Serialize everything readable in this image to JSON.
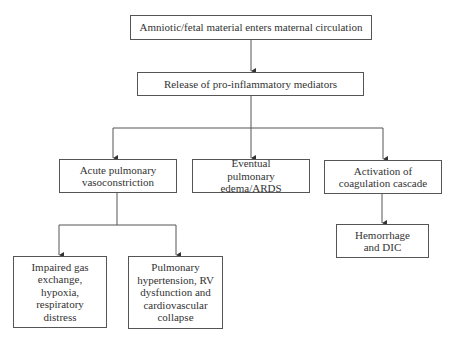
{
  "diagram": {
    "type": "flowchart",
    "nodes": [
      {
        "id": "n1",
        "label": "Amniotic/fetal material enters maternal circulation"
      },
      {
        "id": "n2",
        "label": "Release of pro-inflammatory mediators"
      },
      {
        "id": "n3",
        "label": "Acute pulmonary vasoconstriction"
      },
      {
        "id": "n4",
        "label": "Eventual pulmonary edema/ARDS"
      },
      {
        "id": "n5",
        "label": "Activation of coagulation cascade"
      },
      {
        "id": "n6",
        "label": "Impaired gas exchange, hypoxia, respiratory distress"
      },
      {
        "id": "n7",
        "label": "Pulmonary hypertension, RV dysfunction and cardiovascular collapse"
      },
      {
        "id": "n8",
        "label": "Hemorrhage and DIC"
      }
    ],
    "edges": [
      {
        "from": "n1",
        "to": "n2"
      },
      {
        "from": "n2",
        "to": "n3"
      },
      {
        "from": "n2",
        "to": "n4"
      },
      {
        "from": "n2",
        "to": "n5"
      },
      {
        "from": "n3",
        "to": "n6"
      },
      {
        "from": "n3",
        "to": "n7"
      },
      {
        "from": "n5",
        "to": "n8"
      }
    ],
    "colors": {
      "line": "#555555",
      "box_border": "#555555",
      "text": "#333333",
      "background": "#ffffff"
    }
  }
}
